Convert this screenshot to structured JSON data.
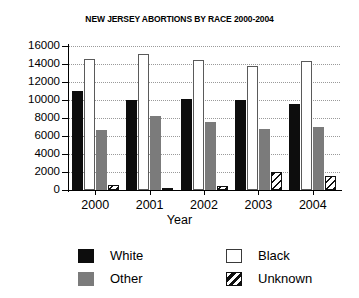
{
  "chart_data": {
    "type": "bar",
    "title": "NEW JERSEY ABORTIONS BY RACE 2000-2004",
    "xlabel": "Year",
    "ylabel": "",
    "categories": [
      "2000",
      "2001",
      "2002",
      "2003",
      "2004"
    ],
    "ylim": [
      0,
      16000
    ],
    "yticks": [
      "0",
      "2000",
      "4000",
      "6000",
      "8000",
      "10000",
      "12000",
      "14000",
      "16000"
    ],
    "ytick_values": [
      0,
      2000,
      4000,
      6000,
      8000,
      10000,
      12000,
      14000,
      16000
    ],
    "grid": true,
    "grid_axis": "y",
    "legend_position": "bottom",
    "series": [
      {
        "name": "White",
        "style": "solid-black",
        "color": "#0d0d0d",
        "values": [
          11000,
          10050,
          10150,
          10050,
          9600
        ]
      },
      {
        "name": "Black",
        "style": "outline-white",
        "color": "#ffffff",
        "values": [
          14600,
          15150,
          14500,
          13750,
          14300
        ]
      },
      {
        "name": "Other",
        "style": "solid-gray",
        "color": "#7b7b7b",
        "values": [
          6650,
          8250,
          7550,
          6750,
          6950
        ]
      },
      {
        "name": "Unknown",
        "style": "diagonal-hatch",
        "color": "#101010",
        "values": [
          600,
          100,
          400,
          2000,
          1550
        ]
      }
    ]
  },
  "legend": {
    "items": [
      {
        "label": "White",
        "swatch": "swatch-solid-black"
      },
      {
        "label": "Black",
        "swatch": "swatch-outline-white"
      },
      {
        "label": "Other",
        "swatch": "swatch-solid-gray"
      },
      {
        "label": "Unknown",
        "swatch": "swatch-diagonal-hatch"
      }
    ]
  }
}
